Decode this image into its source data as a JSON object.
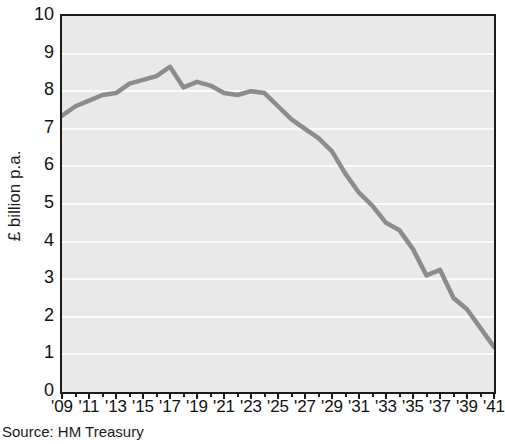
{
  "figure": {
    "source_note": "Source: HM Treasury",
    "ylabel": "£ billion p.a.",
    "line_color": "#8c8c8c",
    "plot_background": "#e9e9e9",
    "gridline_color": "#fbfbfb",
    "axis_color": "#1c1c1c"
  },
  "chart_data": {
    "type": "line",
    "title": "",
    "xlabel": "",
    "ylabel": "£ billion p.a.",
    "xlim": [
      2009,
      2041
    ],
    "ylim": [
      0,
      10
    ],
    "grid": true,
    "legend": null,
    "ytick_labels": [
      "0",
      "1",
      "2",
      "3",
      "4",
      "5",
      "6",
      "7",
      "8",
      "9",
      "10"
    ],
    "ytick_values": [
      0,
      1,
      2,
      3,
      4,
      5,
      6,
      7,
      8,
      9,
      10
    ],
    "xtick_labels": [
      "'09",
      "'11",
      "'13",
      "'15",
      "'17",
      "'19",
      "'21",
      "'23",
      "'25",
      "'27",
      "'29",
      "'31",
      "'33",
      "'35",
      "'37",
      "'39",
      "'41"
    ],
    "xtick_values": [
      2009,
      2011,
      2013,
      2015,
      2017,
      2019,
      2021,
      2023,
      2025,
      2027,
      2029,
      2031,
      2033,
      2035,
      2037,
      2039,
      2041
    ],
    "x": [
      2009,
      2010,
      2011,
      2012,
      2013,
      2014,
      2015,
      2016,
      2017,
      2018,
      2019,
      2020,
      2021,
      2022,
      2023,
      2024,
      2025,
      2026,
      2027,
      2028,
      2029,
      2030,
      2031,
      2032,
      2033,
      2034,
      2035,
      2036,
      2037,
      2038,
      2039,
      2040,
      2041
    ],
    "values": [
      7.35,
      7.6,
      7.75,
      7.9,
      7.95,
      8.2,
      8.3,
      8.4,
      8.65,
      8.1,
      8.25,
      8.15,
      7.95,
      7.9,
      8.0,
      7.95,
      7.6,
      7.25,
      7.0,
      6.75,
      6.4,
      5.8,
      5.3,
      4.95,
      4.5,
      4.3,
      3.8,
      3.1,
      3.25,
      2.5,
      2.2,
      1.7,
      1.2
    ],
    "series_name": ""
  }
}
